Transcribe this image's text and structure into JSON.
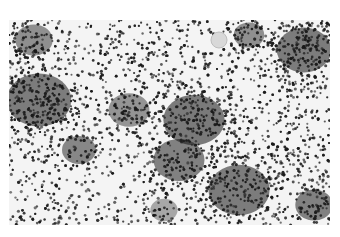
{
  "image": {
    "description": "Grayscale micrograph of densely packed dark particles with clustered dark regions and lighter sparse areas",
    "palette": {
      "background": "#ffffff",
      "particle": "#1a1a1a",
      "cluster": "#0d0d0d",
      "field": "#f4f4f4"
    },
    "frame": {
      "x": 9,
      "y": 20,
      "width": 321,
      "height": 205
    },
    "clusters": [
      {
        "cx": 30,
        "cy": 80,
        "r": 38,
        "density": 0.95
      },
      {
        "cx": 25,
        "cy": 20,
        "r": 22,
        "density": 0.8
      },
      {
        "cx": 70,
        "cy": 130,
        "r": 20,
        "density": 0.85
      },
      {
        "cx": 120,
        "cy": 90,
        "r": 24,
        "density": 0.75
      },
      {
        "cx": 185,
        "cy": 100,
        "r": 36,
        "density": 0.97
      },
      {
        "cx": 170,
        "cy": 140,
        "r": 30,
        "density": 0.9
      },
      {
        "cx": 230,
        "cy": 170,
        "r": 36,
        "density": 0.95
      },
      {
        "cx": 295,
        "cy": 30,
        "r": 32,
        "density": 0.95
      },
      {
        "cx": 305,
        "cy": 185,
        "r": 22,
        "density": 0.9
      },
      {
        "cx": 240,
        "cy": 15,
        "r": 18,
        "density": 0.8
      },
      {
        "cx": 155,
        "cy": 190,
        "r": 16,
        "density": 0.6
      }
    ],
    "clearings": [
      {
        "cx": 105,
        "cy": 175,
        "r": 30
      },
      {
        "cx": 75,
        "cy": 45,
        "r": 14
      },
      {
        "cx": 260,
        "cy": 110,
        "r": 16
      },
      {
        "cx": 280,
        "cy": 165,
        "r": 12
      },
      {
        "cx": 10,
        "cy": 140,
        "r": 12
      }
    ],
    "halo": {
      "cx": 210,
      "cy": 20,
      "r": 8
    }
  }
}
